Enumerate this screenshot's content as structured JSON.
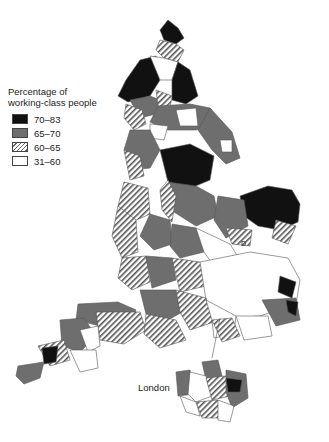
{
  "legend": {
    "title_line1": "Percentage of",
    "title_line2": "working-class people",
    "items": [
      {
        "label": "70–83",
        "fill": "#111111",
        "pattern": "solid-black"
      },
      {
        "label": "65–70",
        "fill": "#6e6e6e",
        "pattern": "solid-gray"
      },
      {
        "label": "60–65",
        "fill": "#ffffff",
        "pattern": "diagonal-hatch"
      },
      {
        "label": "31–60",
        "fill": "#ffffff",
        "pattern": "white"
      }
    ]
  },
  "labels": {
    "inset": "London",
    "marker": "D"
  },
  "map": {
    "region": "England",
    "inset_region": "London"
  }
}
